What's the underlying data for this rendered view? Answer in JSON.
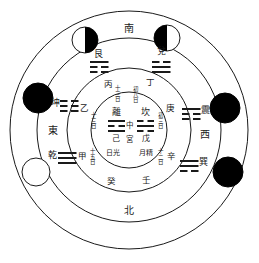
{
  "colors": {
    "line": "#1a1a1a",
    "ink": "#1a1a1a",
    "dark_moon": "#000000",
    "light_moon": "#ffffff",
    "background": "#ffffff"
  },
  "directions": {
    "south": "南",
    "north": "北",
    "east": "東",
    "west": "西"
  },
  "trigrams": [
    {
      "name": "艮",
      "lines": [
        "broken",
        "broken",
        "solid"
      ],
      "position": "upper-left"
    },
    {
      "name": "兌",
      "lines": [
        "broken",
        "solid",
        "solid"
      ],
      "position": "upper-right"
    },
    {
      "name": "坤",
      "lines": [
        "broken",
        "broken",
        "broken"
      ],
      "position": "left-upper"
    },
    {
      "name": "乾",
      "lines": [
        "solid",
        "solid",
        "solid"
      ],
      "position": "left-lower"
    },
    {
      "name": "震",
      "lines": [
        "solid",
        "broken",
        "broken"
      ],
      "position": "right-upper"
    },
    {
      "name": "巽",
      "lines": [
        "solid",
        "solid",
        "broken"
      ],
      "position": "right-lower"
    }
  ],
  "center": {
    "left_trigram": {
      "name": "離",
      "lines": [
        "solid",
        "broken",
        "solid"
      ]
    },
    "right_trigram": {
      "name": "坎",
      "lines": [
        "broken",
        "solid",
        "broken"
      ]
    },
    "middle_top": "中",
    "middle_bottom": "宮",
    "left_stem": "己",
    "right_stem": "戊",
    "left_sub": "日光",
    "right_sub": "月精"
  },
  "stems": [
    {
      "label": "丙",
      "day": "十三日",
      "position": "inner-top-left"
    },
    {
      "label": "丁",
      "day": "初八日",
      "position": "inner-top-right"
    },
    {
      "label": "乙",
      "day": "十三日",
      "position": "inner-left-upper"
    },
    {
      "label": "甲",
      "day": "十五日",
      "position": "inner-left-lower"
    },
    {
      "label": "庚",
      "day": "初三日",
      "position": "inner-right-upper"
    },
    {
      "label": "辛",
      "day": "十二日",
      "position": "inner-right-lower"
    },
    {
      "label": "癸",
      "day": "",
      "position": "inner-bottom-left"
    },
    {
      "label": "壬",
      "day": "",
      "position": "inner-bottom-right"
    }
  ],
  "moons": [
    {
      "phase": "waning-right-dark",
      "position": "top-left"
    },
    {
      "phase": "waxing-left-dark",
      "position": "top-right"
    },
    {
      "phase": "new-dark",
      "position": "left-upper"
    },
    {
      "phase": "full-light",
      "position": "left-lower"
    },
    {
      "phase": "new-dark",
      "position": "right-upper"
    },
    {
      "phase": "new-dark",
      "position": "right-lower"
    }
  ],
  "rings": {
    "outer_radius": 120,
    "middle_radius": 92,
    "inner_radius": 62,
    "core_radius": 38
  }
}
